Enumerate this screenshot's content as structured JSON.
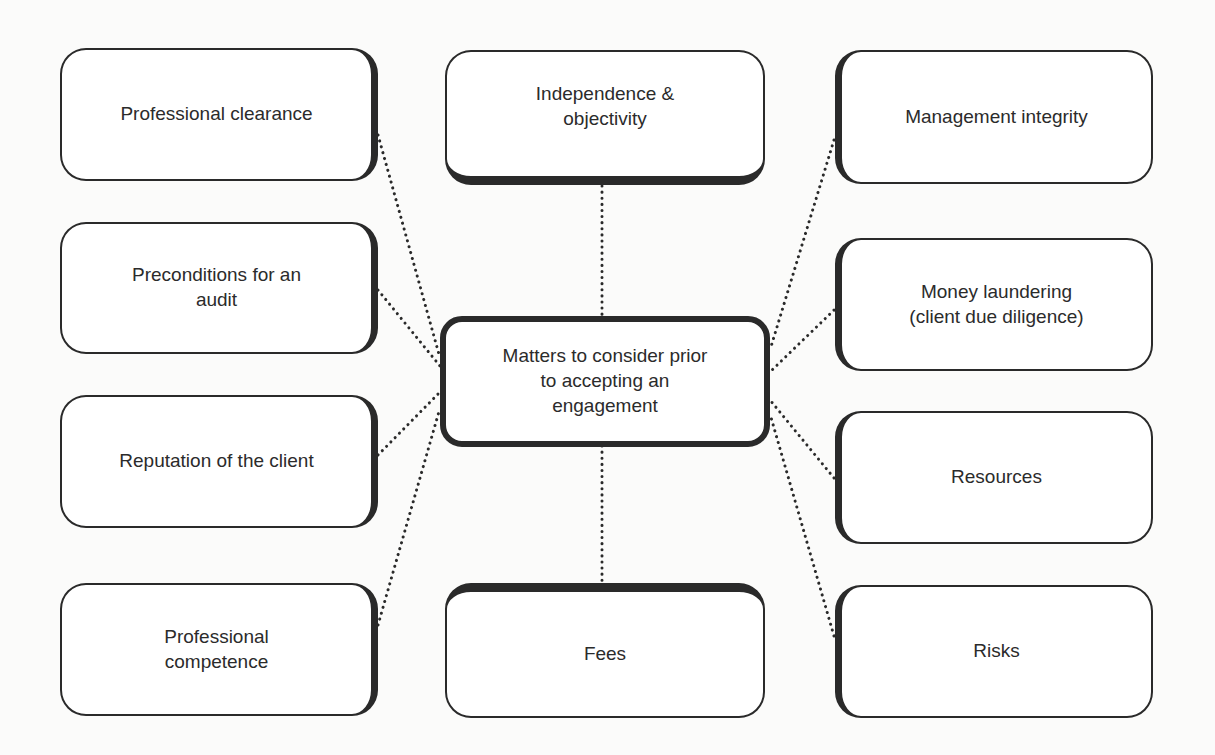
{
  "diagram": {
    "center": {
      "label": "Matters to consider prior\nto accepting an\nengagement"
    },
    "nodes": [
      {
        "id": "professional-clearance",
        "label": "Professional clearance"
      },
      {
        "id": "preconditions",
        "label": "Preconditions for an\naudit"
      },
      {
        "id": "reputation",
        "label": "Reputation of the client"
      },
      {
        "id": "professional-competence",
        "label": "Professional\ncompetence"
      },
      {
        "id": "independence",
        "label": "Independence &\nobjectivity"
      },
      {
        "id": "fees",
        "label": "Fees"
      },
      {
        "id": "management-integrity",
        "label": "Management integrity"
      },
      {
        "id": "money-laundering",
        "label": "Money laundering\n(client due diligence)"
      },
      {
        "id": "resources",
        "label": "Resources"
      },
      {
        "id": "risks",
        "label": "Risks"
      }
    ],
    "connector_style": "dotted",
    "colors": {
      "stroke": "#2a2a2a",
      "background": "#fbfbfa",
      "node_fill": "#ffffff"
    }
  }
}
